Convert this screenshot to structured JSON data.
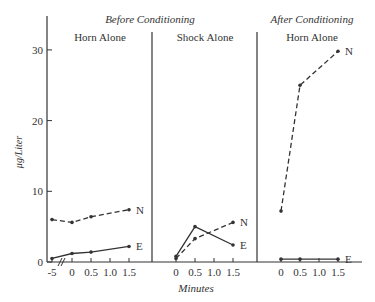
{
  "chart_data": {
    "type": "line",
    "title": "",
    "group_titles": [
      {
        "label": "Before Conditioning",
        "spans_panels": [
          0,
          1
        ]
      },
      {
        "label": "After Conditioning",
        "spans_panels": [
          2
        ]
      }
    ],
    "xlabel": "Minutes",
    "ylabel": "μg/Liter",
    "ylim": [
      0,
      32
    ],
    "yticks": [
      0,
      10,
      20,
      30
    ],
    "grid": false,
    "legend": "inline end labels (N, E)",
    "panels": [
      {
        "title": "Horn Alone",
        "group": "Before Conditioning",
        "xticks": [
          "-5",
          "0",
          "0.5",
          "1.0",
          "1.5"
        ],
        "axis_break": true,
        "series": [
          {
            "name": "N",
            "style": "dashed",
            "x": [
              -5,
              0,
              0.5,
              1.5
            ],
            "values": [
              6.0,
              5.6,
              6.4,
              7.4
            ]
          },
          {
            "name": "E",
            "style": "solid",
            "x": [
              -5,
              0,
              0.5,
              1.5
            ],
            "values": [
              0.5,
              1.2,
              1.4,
              2.2
            ]
          }
        ]
      },
      {
        "title": "Shock Alone",
        "group": "Before Conditioning",
        "xticks": [
          "0",
          "0.5",
          "1.0",
          "1.5"
        ],
        "series": [
          {
            "name": "N",
            "style": "dashed",
            "x": [
              0,
              0.5,
              1.5
            ],
            "values": [
              0.5,
              3.3,
              5.6
            ]
          },
          {
            "name": "E",
            "style": "solid",
            "x": [
              0,
              0.5,
              1.5
            ],
            "values": [
              0.8,
              5.0,
              2.4
            ]
          }
        ]
      },
      {
        "title": "Horn Alone",
        "group": "After Conditioning",
        "xticks": [
          "0",
          "0.5",
          "1.0",
          "1.5"
        ],
        "series": [
          {
            "name": "N",
            "style": "dashed",
            "x": [
              0,
              0.5,
              1.5
            ],
            "values": [
              7.2,
              25.0,
              29.8
            ]
          },
          {
            "name": "E",
            "style": "solid",
            "x": [
              0,
              0.5,
              1.5
            ],
            "values": [
              0.4,
              0.4,
              0.4
            ]
          }
        ]
      }
    ]
  }
}
